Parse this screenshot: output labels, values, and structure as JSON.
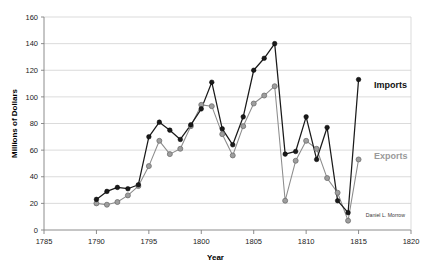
{
  "chart_data": {
    "type": "line",
    "title": "",
    "xlabel": "Year",
    "ylabel": "Millions of Dollars",
    "xlim": [
      1785,
      1820
    ],
    "ylim": [
      0,
      160
    ],
    "xticks": [
      1785,
      1790,
      1795,
      1800,
      1805,
      1810,
      1815,
      1820
    ],
    "yticks": [
      0,
      20,
      40,
      60,
      80,
      100,
      120,
      140,
      160
    ],
    "grid": "horizontal",
    "legend_position": "inline-right",
    "x": [
      1790,
      1791,
      1792,
      1793,
      1794,
      1795,
      1796,
      1797,
      1798,
      1799,
      1800,
      1801,
      1802,
      1803,
      1804,
      1805,
      1806,
      1807,
      1808,
      1809,
      1810,
      1811,
      1812,
      1813,
      1814,
      1815
    ],
    "series": [
      {
        "name": "Imports",
        "color": "#1a1a1a",
        "marker": "filled-circle",
        "values": [
          23,
          29,
          32,
          31,
          34,
          70,
          81,
          75,
          68,
          79,
          91,
          111,
          76,
          64,
          85,
          120,
          129,
          140,
          57,
          59,
          85,
          53,
          77,
          22,
          13,
          113
        ]
      },
      {
        "name": "Exports",
        "color": "#8c8c8c",
        "marker": "gray-circle",
        "values": [
          20,
          19,
          21,
          26,
          33,
          48,
          67,
          57,
          61,
          78,
          94,
          93,
          72,
          56,
          78,
          95,
          101,
          108,
          22,
          52,
          67,
          61,
          39,
          28,
          7,
          53
        ]
      }
    ],
    "annotations": [
      {
        "name": "credit",
        "text": "Daniel L. Morrow"
      }
    ]
  },
  "labels": {
    "y_axis_title": "Millions of Dollars",
    "x_axis_title": "Year",
    "imports_label": "Imports",
    "exports_label": "Exports",
    "credit": "Daniel L. Morrow"
  }
}
